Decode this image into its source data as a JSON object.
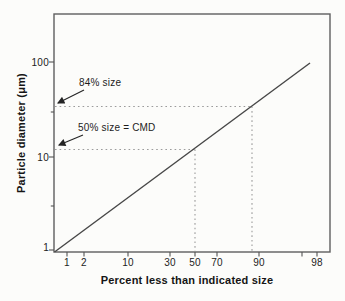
{
  "colors": {
    "background": "#fcfcfa",
    "frame": "#5f5f5f",
    "series_line": "#474747",
    "dotted_guide": "#9b9b9b",
    "tick": "#555555",
    "text": "#1c1c1c",
    "arrow": "#242424"
  },
  "chart_data": {
    "type": "line",
    "title": "",
    "xlabel": "Percent less than indicated size",
    "ylabel": "Particle diameter (μm)",
    "x_scale": "probability",
    "y_scale": "log",
    "xlim": [
      1,
      98
    ],
    "ylim": [
      1,
      320
    ],
    "grid": false,
    "legend": "none",
    "x_ticks": [
      {
        "value": 1,
        "label": "1"
      },
      {
        "value": 2,
        "label": "2"
      },
      {
        "value": 10,
        "label": "10"
      },
      {
        "value": 30,
        "label": "30"
      },
      {
        "value": 50,
        "label": "50"
      },
      {
        "value": 70,
        "label": "70"
      },
      {
        "value": 90,
        "label": "90"
      },
      {
        "value": 95,
        "label": ""
      },
      {
        "value": 98,
        "label": "98"
      }
    ],
    "y_ticks": [
      {
        "value": 1,
        "label": "1"
      },
      {
        "value": 3,
        "label": ""
      },
      {
        "value": 10,
        "label": "10"
      },
      {
        "value": 30,
        "label": ""
      },
      {
        "value": 100,
        "label": "100"
      }
    ],
    "series": [
      {
        "name": "cumulative lognormal size distribution (straight line on log-probability axes)",
        "points": [
          {
            "percent": 1,
            "diameter_um": 1
          },
          {
            "percent": 50,
            "diameter_um": 12
          },
          {
            "percent": 84,
            "diameter_um": 34
          },
          {
            "percent": 97,
            "diameter_um": 100
          }
        ]
      }
    ],
    "guides": [
      {
        "label": "84% size",
        "percent": 84,
        "diameter_um": 34
      },
      {
        "label": "50% size = CMD",
        "percent": 50,
        "diameter_um": 12
      }
    ]
  }
}
